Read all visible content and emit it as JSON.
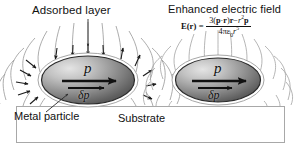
{
  "figure": {
    "title_left": "Adsorbed layer",
    "title_right": "Enhanced electric field",
    "background": "#ffffff"
  },
  "labels": {
    "adsorbed_layer": "Adsorbed layer",
    "enhanced_electric_field": "Enhanced electric field",
    "metal_particle": "Metal particle",
    "substrate": "Substrate"
  },
  "equation": {
    "lhs": "E(r)",
    "equals": "=",
    "numerator": "3(p · r)r − r²p",
    "denominator": "4πε₀r⁵",
    "parts": {
      "e": "E",
      "paren_open": "(",
      "r_lhs": "r",
      "paren_close": ")",
      "three": "3",
      "num_open": "(",
      "p1": "p",
      "dot": "·",
      "r1": "r",
      "num_close": ")",
      "r2": "r",
      "minus": "−",
      "r3": "r",
      "r3_exp": "2",
      "p2": "p",
      "four": "4",
      "pi": "π",
      "epsilon": "ε",
      "epsilon_sub": "0",
      "r_den": "r",
      "r_den_exp": "5"
    }
  },
  "particles": [
    {
      "name": "left-particle",
      "dipole_label": "p",
      "delta_dipole_label": "δp",
      "has_field_arrowheads": true
    },
    {
      "name": "right-particle",
      "dipole_label": "p",
      "delta_dipole_label": "δp",
      "has_field_arrowheads": false
    }
  ],
  "colors": {
    "background": "#ffffff",
    "field_line": "#9a9a9a",
    "arrowhead": "#1a1a1a",
    "particle_dark": "#4a4a4a",
    "particle_light": "#d8d8d8",
    "particle_outline": "#2b2b2b",
    "substrate_fill": "#ffffff",
    "substrate_border": "#a8a8a8",
    "text": "#111111"
  }
}
